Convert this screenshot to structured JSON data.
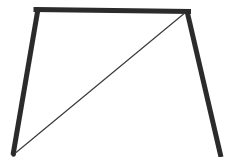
{
  "figure": {
    "kind": "geometry-line-drawing",
    "title": "Trapezoid with one diagonal drawn",
    "canvas": {
      "width": 229,
      "height": 157
    },
    "background_color": "#ffffff",
    "stroke_color": "#2b2b2b",
    "diagonal_stroke_color": "#3a3a3a",
    "thick_stroke_width": 5,
    "thin_stroke_width": 1.2,
    "vertices": {
      "top_left": {
        "label": "top-left-vertex",
        "x": 38,
        "y": 9
      },
      "top_right": {
        "label": "top-right-vertex",
        "x": 187,
        "y": 11
      },
      "bottom_left": {
        "label": "bottom-left-vertex",
        "x": 13,
        "y": 155
      },
      "bottom_right": {
        "label": "bottom-right-vertex-offscreen",
        "x": 221,
        "y": 157
      }
    },
    "edges": [
      {
        "name": "top-edge",
        "from": "top_left",
        "to": "top_right",
        "weight": "thick",
        "x1": 38,
        "y1": 9,
        "x2": 187,
        "y2": 11
      },
      {
        "name": "left-edge",
        "from": "top_left",
        "to": "bottom_left",
        "weight": "thick",
        "x1": 38,
        "y1": 9,
        "x2": 13,
        "y2": 155
      },
      {
        "name": "right-edge",
        "from": "top_right",
        "to": "bottom_right",
        "weight": "thick",
        "x1": 187,
        "y1": 11,
        "x2": 221,
        "y2": 157
      },
      {
        "name": "diagonal",
        "from": "bottom_left",
        "to": "top_right",
        "weight": "thin",
        "x1": 13,
        "y1": 155,
        "x2": 187,
        "y2": 11
      }
    ]
  }
}
